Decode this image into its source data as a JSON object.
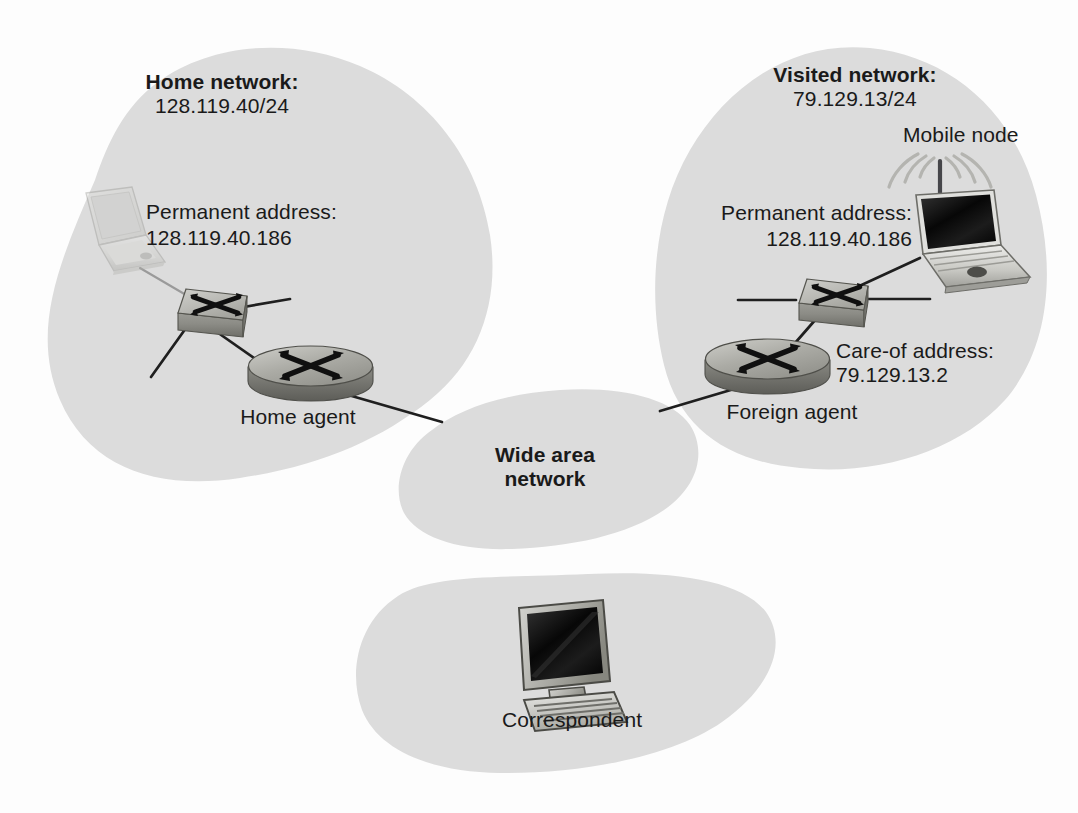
{
  "diagram": {
    "background_color": "#fdfdfd",
    "cloud_fill": "#dcdcdc",
    "line_color": "#1f1f1f",
    "text_color": "#1a1a1a"
  },
  "clouds": [
    {
      "id": "home-network",
      "name": "Home network cloud",
      "title": "Home network:",
      "subnet": "128.119.40/24"
    },
    {
      "id": "visited-network",
      "name": "Visited network cloud",
      "title": "Visited network:",
      "subnet": "79.129.13/24"
    },
    {
      "id": "wide-area-network",
      "name": "Wide area network cloud",
      "title_line1": "Wide area",
      "title_line2": "network"
    },
    {
      "id": "correspondent-network",
      "name": "Correspondent cloud",
      "title": "Correspondent"
    }
  ],
  "labels": {
    "home_permanent_address_line1": "Permanent address:",
    "home_permanent_address_line2": "128.119.40.186",
    "home_agent": "Home agent",
    "mobile_node": "Mobile node",
    "visited_permanent_address_line1": "Permanent address:",
    "visited_permanent_address_line2": "128.119.40.186",
    "care_of_address_line1": "Care-of address:",
    "care_of_address_line2": "79.129.13.2",
    "foreign_agent": "Foreign agent"
  },
  "nodes": [
    {
      "id": "home-laptop",
      "icon": "laptop-icon",
      "label": "",
      "state": "faded"
    },
    {
      "id": "home-switch",
      "icon": "switch-icon",
      "label": ""
    },
    {
      "id": "home-agent-router",
      "icon": "router-icon",
      "label": "Home agent"
    },
    {
      "id": "mobile-laptop",
      "icon": "wireless-laptop-icon",
      "label": "Mobile node"
    },
    {
      "id": "visited-switch",
      "icon": "switch-icon",
      "label": ""
    },
    {
      "id": "foreign-agent-router",
      "icon": "router-icon",
      "label": "Foreign agent"
    },
    {
      "id": "correspondent-pc",
      "icon": "desktop-computer-icon",
      "label": "Correspondent"
    }
  ],
  "links": [
    {
      "from": "home-laptop",
      "to": "home-switch"
    },
    {
      "from": "home-switch",
      "to": "home-stub-right"
    },
    {
      "from": "home-switch",
      "to": "home-stub-left"
    },
    {
      "from": "home-switch",
      "to": "home-agent-router"
    },
    {
      "from": "home-agent-router",
      "to": "wide-area-network"
    },
    {
      "from": "wide-area-network",
      "to": "foreign-agent-router"
    },
    {
      "from": "foreign-agent-router",
      "to": "visited-switch"
    },
    {
      "from": "visited-switch",
      "to": "mobile-laptop"
    },
    {
      "from": "visited-switch",
      "to": "visited-stub-left"
    },
    {
      "from": "visited-switch",
      "to": "visited-stub-right"
    }
  ]
}
